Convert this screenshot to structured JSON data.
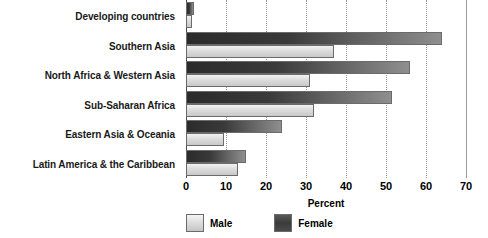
{
  "chart_data": {
    "type": "bar",
    "orientation": "horizontal",
    "title": "",
    "xlabel": "Percent",
    "ylabel": "",
    "xlim": [
      0,
      70
    ],
    "xticks": [
      0,
      10,
      20,
      30,
      40,
      50,
      60,
      70
    ],
    "grid": true,
    "legend_position": "bottom-left",
    "categories": [
      "Developing countries",
      "Southern Asia",
      "North Africa & Western Asia",
      "Sub-Saharan Africa",
      "Eastern Asia & Oceania",
      "Latin America & the Caribbean"
    ],
    "series": [
      {
        "name": "Male",
        "color": "#dcdcdc",
        "values": [
          1.5,
          37,
          31,
          32,
          9.5,
          13
        ]
      },
      {
        "name": "Female",
        "color": "#3a3a3a",
        "values": [
          2,
          64,
          56,
          51.5,
          24,
          15
        ]
      }
    ]
  },
  "axis": {
    "x_title": "Percent",
    "tick_labels": [
      "0",
      "10",
      "20",
      "30",
      "40",
      "50",
      "60",
      "70"
    ]
  },
  "legend": {
    "items": [
      {
        "label": "Male",
        "swatch": "male-swatch"
      },
      {
        "label": "Female",
        "swatch": "female-swatch"
      }
    ]
  }
}
